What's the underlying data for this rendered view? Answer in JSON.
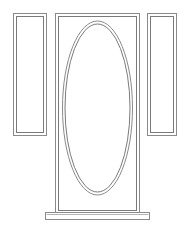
{
  "drawing": {
    "title": "Entry Door Elevation",
    "subject": "single door with oval glass lite and two flanking sidelites",
    "view": "front elevation",
    "background_color": "#ffffff",
    "line_color": "#8a8a8a",
    "line_color_dark": "#7a7a7a",
    "line_width": 1,
    "canvas": {
      "width": 189,
      "height": 231
    }
  },
  "components": {
    "left_sidelite": {
      "label": "Left Sidelite",
      "outer": {
        "x": 13,
        "y": 13,
        "width": 34,
        "height": 123
      },
      "inner": {
        "x": 16,
        "y": 16,
        "width": 28,
        "height": 117
      },
      "stroke": "#8a8a8a"
    },
    "right_sidelite": {
      "label": "Right Sidelite",
      "outer": {
        "x": 147,
        "y": 13,
        "width": 30,
        "height": 123
      },
      "inner": {
        "x": 150,
        "y": 16,
        "width": 24,
        "height": 117
      },
      "stroke": "#8a8a8a"
    },
    "door_slab": {
      "label": "Door Slab",
      "outer": {
        "x": 55,
        "y": 13,
        "width": 85,
        "height": 201
      },
      "inner": {
        "x": 58,
        "y": 16,
        "width": 79,
        "height": 195
      },
      "stroke": "#8a8a8a"
    },
    "oval_lite": {
      "label": "Oval Glass Lite",
      "outer": {
        "cx": 97.5,
        "cy": 108,
        "rx": 35,
        "ry": 87
      },
      "inner": {
        "cx": 97.5,
        "cy": 108,
        "rx": 32.5,
        "ry": 84
      },
      "stroke": "#8a8a8a"
    },
    "threshold": {
      "label": "Threshold Sill",
      "outer": {
        "x": 45,
        "y": 212,
        "width": 105,
        "height": 8
      },
      "inner": {
        "x": 47,
        "y": 214,
        "width": 101,
        "height": 4
      },
      "stroke": "#8a8a8a"
    }
  }
}
